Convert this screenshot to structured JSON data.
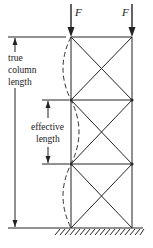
{
  "diagram": {
    "colors": {
      "stroke": "#222222",
      "background": "#ffffff"
    },
    "loads": [
      {
        "label": "F",
        "x": 71
      },
      {
        "label": "F",
        "x": 132
      }
    ],
    "labels": {
      "true_length": [
        "true",
        "column",
        "length"
      ],
      "effective_length": [
        "effective",
        "length"
      ]
    },
    "geometry": {
      "left_column_x": 71,
      "right_column_x": 132,
      "beam_levels_y": [
        37,
        100,
        164,
        228
      ],
      "ground_y": 228,
      "buckled_shape": "three alternating half-waves (dashed)"
    }
  }
}
